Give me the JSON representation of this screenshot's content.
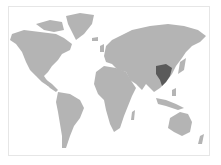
{
  "map": {
    "type": "world-choropleth",
    "land_color": "#b4b4b4",
    "highlight_color": "#5a5a5a",
    "background_color": "#ffffff",
    "frame_color": "#e6e6e6",
    "highlighted_regions": [
      {
        "name": "highlighted-region-east-asia",
        "color": "#5a5a5a"
      }
    ]
  }
}
